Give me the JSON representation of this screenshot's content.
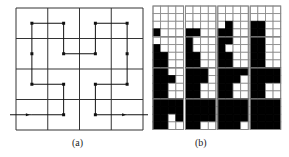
{
  "figure": {
    "panel_a": {
      "caption": "(a)",
      "grid": {
        "rows": 4,
        "cols": 4
      },
      "curve": "hilbert",
      "path_order": [
        [
          3,
          0
        ],
        [
          3,
          1
        ],
        [
          2,
          1
        ],
        [
          2,
          0
        ],
        [
          1,
          0
        ],
        [
          0,
          0
        ],
        [
          0,
          1
        ],
        [
          1,
          1
        ],
        [
          1,
          2
        ],
        [
          0,
          2
        ],
        [
          0,
          3
        ],
        [
          1,
          3
        ],
        [
          2,
          3
        ],
        [
          2,
          2
        ],
        [
          3,
          2
        ],
        [
          3,
          3
        ]
      ]
    },
    "panel_b": {
      "caption": "(b)",
      "layout": {
        "rows": 4,
        "cols": 4
      },
      "cell_grid": {
        "rows": 4,
        "cols": 4
      },
      "description": "Sequence of 16 grids where cells are filled black progressively in Hilbert-curve order; grid k has the first k cells filled."
    },
    "colors": {
      "line": "#333333",
      "fill": "#000000",
      "background": "#ffffff",
      "cell_border": "#888888"
    }
  }
}
